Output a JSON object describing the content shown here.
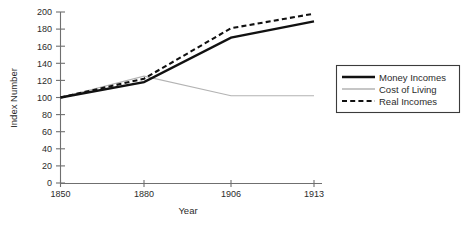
{
  "chart_data": {
    "type": "line",
    "title": "",
    "xlabel": "Year",
    "ylabel": "Index Number",
    "categories": [
      "1850",
      "1880",
      "1906",
      "1913"
    ],
    "x": [
      1850,
      1880,
      1906,
      1913
    ],
    "ylim": [
      0,
      200
    ],
    "yticks": [
      0,
      20,
      40,
      60,
      80,
      100,
      120,
      140,
      160,
      180,
      200
    ],
    "ytick_labels": [
      "0",
      "20",
      "40",
      "60",
      "80",
      "100",
      "120",
      "140",
      "160",
      "180",
      "200"
    ],
    "grid": false,
    "legend_position": "right",
    "series": [
      {
        "name": "Money Incomes",
        "values": [
          100,
          118,
          170,
          189
        ],
        "style": "solid-thick",
        "color": "#111111"
      },
      {
        "name": "Cost of Living",
        "values": [
          100,
          125,
          102,
          102
        ],
        "style": "solid-thin",
        "color": "#b3b3b3"
      },
      {
        "name": "Real Incomes",
        "values": [
          100,
          122,
          181,
          198
        ],
        "style": "dashed",
        "color": "#111111"
      }
    ]
  },
  "axes": {
    "y_title": "Index Number",
    "x_title": "Year",
    "y_labels": {
      "t0": "0",
      "t20": "20",
      "t40": "40",
      "t60": "60",
      "t80": "80",
      "t100": "100",
      "t120": "120",
      "t140": "140",
      "t160": "160",
      "t180": "180",
      "t200": "200"
    },
    "x_labels": {
      "c0": "1850",
      "c1": "1880",
      "c2": "1906",
      "c3": "1913"
    }
  },
  "legend": {
    "entries": {
      "money": "Money Incomes",
      "cost": "Cost of Living",
      "real": "Real Incomes"
    }
  },
  "colors": {
    "money_incomes": "#111111",
    "cost_of_living": "#b3b3b3",
    "real_incomes": "#111111",
    "axis": "#6f6f6f",
    "text": "#2b2b2b",
    "background": "#ffffff",
    "legend_border": "#3b3b3b"
  }
}
